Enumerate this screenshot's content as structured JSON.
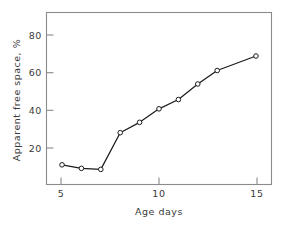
{
  "chart_data": {
    "type": "line",
    "title": "",
    "subtitle": "",
    "xlabel": "Age days",
    "ylabel": "Apparent free space, %",
    "xlim": [
      4.2,
      15.8
    ],
    "ylim": [
      7,
      90
    ],
    "xticks": [
      5,
      10,
      15
    ],
    "xtick_labels": [
      "5",
      "10",
      "15"
    ],
    "yticks": [
      20,
      40,
      60,
      80
    ],
    "ytick_labels": [
      "20",
      "40",
      "60",
      "80"
    ],
    "grid": false,
    "legend": "none",
    "marker": "open-circle",
    "line_color": "#1c1c1c",
    "marker_face_color": "#ffffff",
    "frame_color": "#8a8a8a",
    "background_color": "#ffffff",
    "x": [
      5,
      6,
      7,
      8,
      9,
      10,
      11,
      12,
      13,
      15
    ],
    "values": [
      16.5,
      14.8,
      14.3,
      32,
      37,
      43.5,
      48,
      55.5,
      62,
      69
    ],
    "series": [
      {
        "name": "Apparent free space",
        "points": [
          {
            "x": 5,
            "y": 16.5
          },
          {
            "x": 6,
            "y": 14.8
          },
          {
            "x": 7,
            "y": 14.3
          },
          {
            "x": 8,
            "y": 32.0
          },
          {
            "x": 9,
            "y": 37.0
          },
          {
            "x": 10,
            "y": 43.5
          },
          {
            "x": 11,
            "y": 48.0
          },
          {
            "x": 12,
            "y": 55.5
          },
          {
            "x": 13,
            "y": 62.0
          },
          {
            "x": 15,
            "y": 69.0
          }
        ]
      }
    ]
  },
  "axes": {
    "x_title": "Age days",
    "y_title": "Apparent free space, %"
  }
}
